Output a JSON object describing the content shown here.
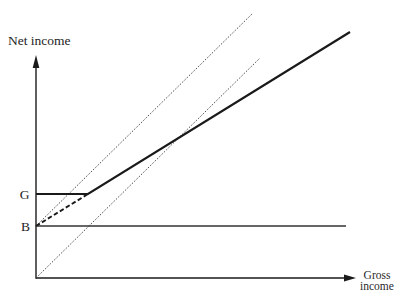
{
  "figure": {
    "y_axis_label": "Net income",
    "x_axis_label_line1": "Gross",
    "x_axis_label_line2": "income"
  },
  "chart_data": {
    "type": "line",
    "title": "",
    "xlabel": "Gross income",
    "ylabel": "Net income",
    "xlim": [
      0,
      320
    ],
    "ylim": [
      0,
      223
    ],
    "grid": false,
    "legend": null,
    "axis_color": "#1a1a1a",
    "y_ticks": [
      {
        "label": "G",
        "value": 84
      },
      {
        "label": "B",
        "value": 52
      }
    ],
    "x_ticks": [],
    "series": [
      {
        "name": "45-degree line from origin",
        "style": "dotted",
        "color": "#3a3a3a",
        "points": [
          [
            0,
            0
          ],
          [
            224,
            220
          ]
        ]
      },
      {
        "name": "45-degree line from B",
        "style": "dotted",
        "color": "#3a3a3a",
        "points": [
          [
            0,
            52
          ],
          [
            217,
            265
          ]
        ]
      },
      {
        "name": "Horizontal line at B",
        "style": "solid-thin",
        "color": "#333333",
        "points": [
          [
            0,
            52
          ],
          [
            310,
            52
          ]
        ]
      },
      {
        "name": "Net income schedule (G floor, then rising)",
        "style": "solid-thick",
        "color": "#1a1a1a",
        "points": [
          [
            0,
            84
          ],
          [
            52,
            84
          ],
          [
            314,
            246
          ]
        ]
      },
      {
        "name": "Dashed extension from B to kink",
        "style": "dashed",
        "color": "#1a1a1a",
        "points": [
          [
            0,
            52
          ],
          [
            52,
            84
          ]
        ]
      }
    ]
  }
}
